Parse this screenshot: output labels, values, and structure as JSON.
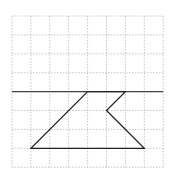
{
  "diagram": {
    "type": "grid-geometry",
    "grid": {
      "columns": 8,
      "rows": 8,
      "origin_px": [
        12,
        16
      ],
      "cell_px": 18.9,
      "line_color": "#b8b8b8",
      "line_style": "dashed"
    },
    "reference_line": {
      "row_index": 4,
      "color": "#444444"
    },
    "shape": {
      "stroke": "#222222",
      "vertices_grid": [
        [
          4,
          4
        ],
        [
          1,
          7
        ],
        [
          7,
          7
        ],
        [
          5,
          5
        ],
        [
          6,
          4
        ]
      ]
    }
  }
}
